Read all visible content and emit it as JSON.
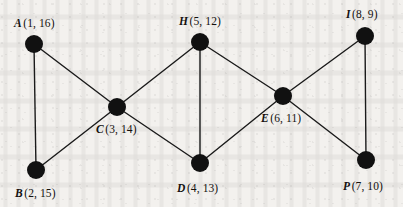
{
  "figure": {
    "kind": "undirected-graph",
    "background_color": "#f3f1ee",
    "node_color": "#111111",
    "edge_color": "#1a1a1a",
    "label_color": "#14110f",
    "node_radius": 9,
    "edge_width": 1.4,
    "width": 403,
    "height": 207
  },
  "nodes": [
    {
      "id": "A",
      "vid": "A",
      "pair": "(1, 16)",
      "label": "A (1, 16)",
      "x": 34,
      "y": 44,
      "label_x": 14,
      "label_y": 18,
      "label_side": "above-left"
    },
    {
      "id": "B",
      "vid": "B",
      "pair": "(2, 15)",
      "label": "B (2, 15)",
      "x": 36,
      "y": 170,
      "label_x": 15,
      "label_y": 188,
      "label_side": "below-left"
    },
    {
      "id": "C",
      "vid": "C",
      "pair": "(3, 14)",
      "label": "C (3, 14)",
      "x": 117,
      "y": 107,
      "label_x": 96,
      "label_y": 124,
      "label_side": "below"
    },
    {
      "id": "D",
      "vid": "D",
      "pair": "(4, 13)",
      "label": "D (4, 13)",
      "x": 200,
      "y": 163,
      "label_x": 177,
      "label_y": 183,
      "label_side": "below"
    },
    {
      "id": "H",
      "vid": "H",
      "pair": "(5, 12)",
      "label": "H (5, 12)",
      "x": 200,
      "y": 42,
      "label_x": 179,
      "label_y": 16,
      "label_side": "above"
    },
    {
      "id": "E",
      "vid": "E",
      "pair": "(6, 11)",
      "label": "E (6, 11)",
      "x": 283,
      "y": 96,
      "label_x": 261,
      "label_y": 113,
      "label_side": "below"
    },
    {
      "id": "P",
      "vid": "P",
      "pair": "(7, 10)",
      "label": "P (7, 10)",
      "x": 366,
      "y": 160,
      "label_x": 343,
      "label_y": 181,
      "label_side": "below"
    },
    {
      "id": "I",
      "vid": "I",
      "pair": "(8, 9)",
      "label": "I (8, 9)",
      "x": 365,
      "y": 36,
      "label_x": 346,
      "label_y": 9,
      "label_side": "above"
    }
  ],
  "edges": [
    {
      "id": "A-B",
      "from": "A",
      "to": "B"
    },
    {
      "id": "A-C",
      "from": "A",
      "to": "C"
    },
    {
      "id": "B-C",
      "from": "B",
      "to": "C"
    },
    {
      "id": "C-H",
      "from": "C",
      "to": "H"
    },
    {
      "id": "C-D",
      "from": "C",
      "to": "D"
    },
    {
      "id": "H-D",
      "from": "H",
      "to": "D"
    },
    {
      "id": "H-E",
      "from": "H",
      "to": "E"
    },
    {
      "id": "D-E",
      "from": "D",
      "to": "E"
    },
    {
      "id": "E-I",
      "from": "E",
      "to": "I"
    },
    {
      "id": "E-P",
      "from": "E",
      "to": "P"
    },
    {
      "id": "I-P",
      "from": "I",
      "to": "P"
    }
  ]
}
